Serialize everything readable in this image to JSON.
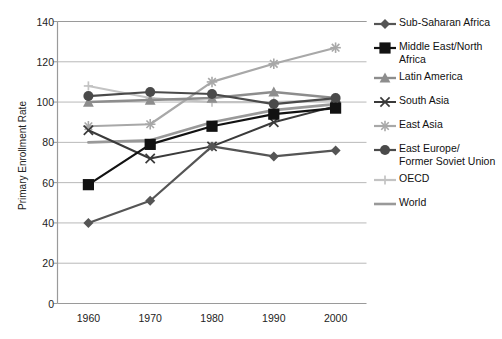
{
  "chart_data": {
    "type": "line",
    "title": "",
    "xlabel": "",
    "ylabel": "Primary Enrollment Rate",
    "x": [
      1960,
      1970,
      1980,
      1990,
      2000
    ],
    "xtick_labels": [
      "1960",
      "1970",
      "1980",
      "1990",
      "2000"
    ],
    "ytick_labels": [
      "0",
      "20",
      "40",
      "60",
      "80",
      "100",
      "120",
      "140"
    ],
    "yticks": [
      0,
      20,
      40,
      60,
      80,
      100,
      120,
      140
    ],
    "ylim": [
      0,
      140
    ],
    "grid": "horizontal",
    "legend_position": "right",
    "series": [
      {
        "name": "Sub-Saharan Africa",
        "label": "Sub-Saharan Africa",
        "values": [
          40,
          51,
          78,
          73,
          76
        ],
        "color": "#555555",
        "marker": "diamond",
        "marker_size": 5.0,
        "line_width": 2.2
      },
      {
        "name": "Middle East/North Africa",
        "label": "Middle East/North\nAfrica",
        "values": [
          59,
          79,
          88,
          94,
          97
        ],
        "color": "#121212",
        "marker": "square",
        "marker_size": 5.6,
        "line_width": 2.2
      },
      {
        "name": "Latin America",
        "label": "Latin America",
        "values": [
          100,
          101,
          102,
          105,
          102
        ],
        "color": "#8d8d8d",
        "marker": "triangle",
        "marker_size": 5.4,
        "line_width": 2.4
      },
      {
        "name": "South Asia",
        "label": "South Asia",
        "values": [
          86,
          72,
          78,
          90,
          98
        ],
        "color": "#3a3a3a",
        "marker": "x",
        "marker_size": 4.6,
        "line_width": 2.0
      },
      {
        "name": "East Asia",
        "label": "East Asia",
        "values": [
          88,
          89,
          110,
          119,
          127
        ],
        "color": "#a8a8a8",
        "marker": "star",
        "marker_size": 5.0,
        "line_width": 2.2
      },
      {
        "name": "East Europe/Former Soviet Union",
        "label": "East Europe/\nFormer Soviet Union",
        "values": [
          103,
          105,
          104,
          99,
          102
        ],
        "color": "#4a4a4a",
        "marker": "circle",
        "marker_size": 5.0,
        "line_width": 2.2
      },
      {
        "name": "OECD",
        "label": "OECD",
        "values": [
          108,
          102,
          100,
          100,
          101
        ],
        "color": "#c3c3c3",
        "marker": "plus",
        "marker_size": 4.6,
        "line_width": 2.2
      },
      {
        "name": "World",
        "label": "World",
        "values": [
          80,
          81,
          90,
          96,
          99
        ],
        "color": "#999999",
        "marker": "none",
        "marker_size": 0,
        "line_width": 2.6
      }
    ]
  },
  "axes": {
    "frame_color": "#9a9a9a",
    "grid_color": "#b9b9b9",
    "tick_text_color": "#222222"
  }
}
